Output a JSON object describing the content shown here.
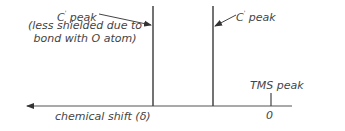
{
  "diagram": {
    "type": "nmr-spectrum-schematic",
    "peaks": [
      {
        "id": "peak_left",
        "label_main": "C",
        "label_sup": "'",
        "label_suffix": " peak",
        "note_line1": "(less shielded due to",
        "note_line2": "bond with O atom)",
        "x": 153,
        "top": 6,
        "bottom": 106
      },
      {
        "id": "peak_right",
        "label_main": "C",
        "label_sup": "'",
        "label_suffix": " peak",
        "x": 213,
        "top": 6,
        "bottom": 106
      },
      {
        "id": "tms",
        "label": "TMS peak",
        "x": 271,
        "top": 93,
        "bottom": 106
      }
    ],
    "axis": {
      "label": "chemical shift (δ)",
      "zero_label": "0",
      "direction": "left",
      "y": 106,
      "x_start": 25,
      "x_end": 292
    },
    "colors": {
      "line": "#444444",
      "text": "#444444",
      "background": "#ffffff"
    }
  }
}
